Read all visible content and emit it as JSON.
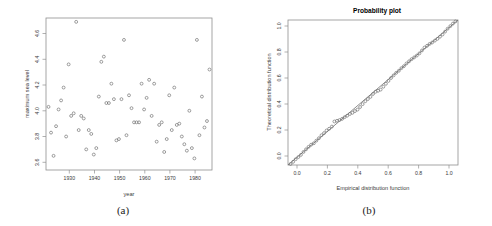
{
  "figure": {
    "caption_a": "(a)",
    "caption_b": "(b)"
  },
  "chart_data": [
    {
      "panel": "a",
      "type": "scatter",
      "title": "",
      "xlabel": "year",
      "ylabel": "maximum sea level",
      "xlim": [
        1922,
        1988
      ],
      "ylim": [
        3.54,
        4.72
      ],
      "grid": false,
      "legend": null,
      "xticks": [
        1930,
        1940,
        1950,
        1960,
        1970,
        1980
      ],
      "yticks": [
        3.6,
        3.8,
        4.0,
        4.2,
        4.4,
        4.6
      ],
      "marker": "open-circle",
      "x": [
        1923,
        1924,
        1925,
        1926,
        1927,
        1928,
        1929,
        1930,
        1931,
        1932,
        1933,
        1934,
        1935,
        1936,
        1937,
        1938,
        1939,
        1940,
        1941,
        1942,
        1943,
        1944,
        1945,
        1946,
        1947,
        1948,
        1949,
        1950,
        1951,
        1952,
        1953,
        1954,
        1955,
        1956,
        1957,
        1958,
        1959,
        1960,
        1961,
        1962,
        1963,
        1964,
        1965,
        1966,
        1967,
        1968,
        1969,
        1970,
        1971,
        1972,
        1973,
        1974,
        1975,
        1976,
        1977,
        1978,
        1979,
        1980,
        1981,
        1982,
        1983,
        1984,
        1985,
        1986,
        1987
      ],
      "y": [
        4.03,
        3.83,
        3.65,
        3.88,
        4.01,
        4.08,
        4.18,
        3.8,
        4.36,
        3.96,
        3.98,
        4.69,
        3.85,
        3.96,
        3.94,
        3.7,
        3.85,
        3.82,
        3.66,
        3.71,
        4.11,
        4.38,
        4.42,
        4.06,
        4.06,
        4.21,
        4.09,
        3.77,
        3.78,
        4.09,
        4.55,
        3.81,
        4.12,
        4.02,
        3.91,
        3.91,
        3.91,
        4.21,
        4.01,
        4.1,
        4.24,
        3.96,
        4.21,
        3.76,
        3.89,
        3.91,
        3.68,
        3.78,
        4.12,
        3.85,
        4.18,
        3.89,
        3.9,
        3.8,
        3.74,
        3.69,
        4.0,
        3.71,
        3.63,
        4.55,
        3.81,
        4.11,
        3.87,
        3.92,
        4.32
      ],
      "n_points": 65
    },
    {
      "panel": "b",
      "type": "scatter",
      "title": "Probability plot",
      "xlabel": "Empirical distribution function",
      "ylabel": "Theoretical distribution function",
      "xlim": [
        0.0,
        1.0
      ],
      "ylim": [
        0.0,
        1.0
      ],
      "grid": false,
      "legend": null,
      "xticks": [
        0.0,
        0.2,
        0.4,
        0.6,
        0.8,
        1.0
      ],
      "yticks": [
        0.0,
        0.2,
        0.4,
        0.6,
        0.8,
        1.0
      ],
      "marker": "open-circle",
      "reference_line": {
        "x0": 0.0,
        "y0": 0.0,
        "x1": 1.0,
        "y1": 1.0
      },
      "x": [
        0.015,
        0.03,
        0.045,
        0.061,
        0.076,
        0.091,
        0.106,
        0.121,
        0.136,
        0.152,
        0.167,
        0.182,
        0.197,
        0.212,
        0.227,
        0.242,
        0.258,
        0.273,
        0.288,
        0.303,
        0.318,
        0.333,
        0.348,
        0.364,
        0.379,
        0.394,
        0.409,
        0.424,
        0.439,
        0.455,
        0.47,
        0.485,
        0.5,
        0.515,
        0.53,
        0.545,
        0.561,
        0.576,
        0.591,
        0.606,
        0.621,
        0.636,
        0.652,
        0.667,
        0.682,
        0.697,
        0.712,
        0.727,
        0.742,
        0.758,
        0.773,
        0.788,
        0.803,
        0.818,
        0.833,
        0.848,
        0.864,
        0.879,
        0.894,
        0.909,
        0.924,
        0.939,
        0.955,
        0.97,
        0.985
      ],
      "y": [
        0.007,
        0.022,
        0.04,
        0.055,
        0.07,
        0.09,
        0.108,
        0.125,
        0.14,
        0.15,
        0.168,
        0.185,
        0.205,
        0.22,
        0.238,
        0.25,
        0.265,
        0.3,
        0.305,
        0.31,
        0.318,
        0.33,
        0.34,
        0.352,
        0.36,
        0.372,
        0.382,
        0.4,
        0.42,
        0.44,
        0.455,
        0.47,
        0.49,
        0.505,
        0.512,
        0.52,
        0.54,
        0.56,
        0.58,
        0.6,
        0.618,
        0.635,
        0.65,
        0.668,
        0.682,
        0.7,
        0.715,
        0.73,
        0.742,
        0.755,
        0.77,
        0.79,
        0.81,
        0.822,
        0.835,
        0.845,
        0.858,
        0.87,
        0.885,
        0.9,
        0.92,
        0.94,
        0.958,
        0.975,
        0.99
      ],
      "n_points": 65
    }
  ]
}
